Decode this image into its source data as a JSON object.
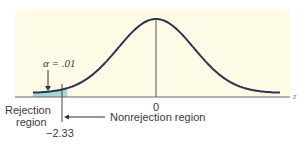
{
  "chart_data": {
    "type": "area",
    "title": "",
    "xlabel": "z",
    "ylabel": "",
    "x_tick_labels": [
      "0"
    ],
    "critical_value": -2.33,
    "critical_value_label": "−2.33",
    "alpha_label": "α = .01",
    "alpha": 0.01,
    "regions": [
      {
        "name": "Rejection region",
        "line1": "Rejection",
        "line2": "region",
        "z_range": [
          -4,
          -2.33
        ],
        "shaded": true
      },
      {
        "name": "Nonrejection region",
        "z_range": [
          -2.33,
          4
        ],
        "shaded": false
      }
    ],
    "curve": "normal(0,1)",
    "x_range": [
      -3.3,
      3.3
    ],
    "grid": false,
    "colors": {
      "background": "#fdfbe6",
      "curve": "#2c3550",
      "shade": "#9fd4d2",
      "axis": "#555555",
      "text": "#3a3a3a"
    }
  }
}
